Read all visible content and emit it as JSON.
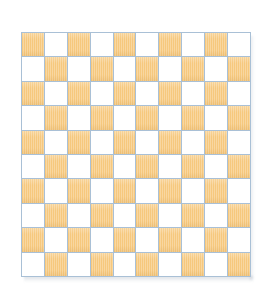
{
  "figure": {
    "name": "checkerboard",
    "background_color": "#ffffff"
  },
  "board": {
    "rows": 10,
    "columns": 10,
    "total_squares": 100,
    "dark_square_count": 50,
    "light_square_count": 50,
    "top_left_square_color": "orange",
    "grid_line_color": "#a9c0d6",
    "dark_color": "#f6c87d",
    "light_color": "#ffffff",
    "shadow_color": "#96a0af",
    "cell_width_px": 23,
    "cell_height_px": 24.5,
    "origin_x_px": 21,
    "origin_y_px": 32,
    "width_px": 230,
    "height_px": 245,
    "pattern": [
      [
        "dark",
        "light",
        "dark",
        "light",
        "dark",
        "light",
        "dark",
        "light",
        "dark",
        "light"
      ],
      [
        "light",
        "dark",
        "light",
        "dark",
        "light",
        "dark",
        "light",
        "dark",
        "light",
        "dark"
      ],
      [
        "dark",
        "light",
        "dark",
        "light",
        "dark",
        "light",
        "dark",
        "light",
        "dark",
        "light"
      ],
      [
        "light",
        "dark",
        "light",
        "dark",
        "light",
        "dark",
        "light",
        "dark",
        "light",
        "dark"
      ],
      [
        "dark",
        "light",
        "dark",
        "light",
        "dark",
        "light",
        "dark",
        "light",
        "dark",
        "light"
      ],
      [
        "light",
        "dark",
        "light",
        "dark",
        "light",
        "dark",
        "light",
        "dark",
        "light",
        "dark"
      ],
      [
        "dark",
        "light",
        "dark",
        "light",
        "dark",
        "light",
        "dark",
        "light",
        "dark",
        "light"
      ],
      [
        "light",
        "dark",
        "light",
        "dark",
        "light",
        "dark",
        "light",
        "dark",
        "light",
        "dark"
      ],
      [
        "dark",
        "light",
        "dark",
        "light",
        "dark",
        "light",
        "dark",
        "light",
        "dark",
        "light"
      ],
      [
        "light",
        "dark",
        "light",
        "dark",
        "light",
        "dark",
        "light",
        "dark",
        "light",
        "dark"
      ]
    ]
  }
}
